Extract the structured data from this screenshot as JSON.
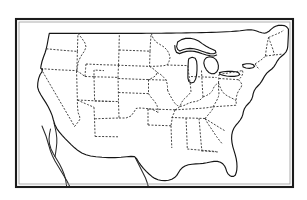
{
  "figure": {
    "title": "Outline map of the contiguous United States",
    "caption": "Black and white line-art map of the lower 48 United States with dashed state boundaries, solid national coastline, the Great Lakes, and a rectangular double-line border frame.",
    "style": "line art, black and white, unlabeled"
  },
  "canvas": {
    "width": 307,
    "height": 200,
    "background_color": "#ffffff"
  },
  "frame": {
    "name": "border-frame",
    "shape": "rectangle",
    "x": 16,
    "y": 19,
    "width": 277,
    "height": 168,
    "outer_stroke_color": "#1c1c1c",
    "outer_stroke_width": 2.1,
    "inner_stroke_color": "#9a9a9a",
    "inner_stroke_width": 0.8,
    "inner_inset": 3,
    "fill_color": "#ffffff"
  },
  "styles": {
    "coastline_color": "#151515",
    "coastline_width": 1.15,
    "state_border_color": "#3b3b3b",
    "state_border_width": 0.95,
    "state_border_dash": "2 1.5",
    "lake_stroke_color": "#151515",
    "lake_fill_color": "#ffffff",
    "neighbor_color": "#2a2a2a"
  },
  "layers": [
    {
      "id": "national-outline",
      "label": "National outline and coastline",
      "visible": true
    },
    {
      "id": "state-boundaries",
      "label": "State boundaries (dashed)",
      "visible": true
    },
    {
      "id": "great-lakes",
      "label": "Great Lakes",
      "visible": true
    },
    {
      "id": "neighbor-outlines",
      "label": "Baja California and adjacent land",
      "visible": true
    }
  ],
  "geography": {
    "regions_depicted": [
      "Pacific Northwest",
      "California coast",
      "Rocky Mountain states",
      "Great Plains",
      "Great Lakes",
      "Northeast and New England",
      "Mid-Atlantic and Chesapeake Bay",
      "Southeast and Florida peninsula",
      "Gulf Coast and Texas"
    ],
    "water_features": [
      "Lake Superior",
      "Lake Michigan",
      "Lake Huron",
      "Lake Erie",
      "Lake Ontario",
      "Chesapeake Bay",
      "Gulf of Mexico",
      "Atlantic Ocean",
      "Pacific Ocean"
    ],
    "state_count": 48,
    "boundary_type": "dashed interior state lines, solid national border"
  },
  "paths": {
    "national_outline": "M 49.5 33.5 L 47.8 40.5 L 46.5 47.0 L 45.2 52.5 L 43.0 57.0 L 41.3 62.5 L 40.8 67.5 L 42.8 69.0 L 41.5 72.5 L 39.5 75.5 L 38.2 80.5 L 37.5 86.0 L 39.0 91.0 L 41.5 95.5 L 44.5 100.5 L 47.5 106.0 L 50.0 111.5 L 52.5 117.0 L 53.5 122.5 L 55.5 127.5 L 58.0 131.5 L 61.5 135.0 L 64.5 138.5 L 67.5 141.5 L 70.5 144.5 L 73.5 147.5 L 76.5 150.5 L 80.0 153.5 L 84.0 155.5 L 88.0 157.0 L 93.0 158.0 L 99.0 158.5 L 105.0 159.0 L 112.0 159.2 L 118.0 159.0 L 124.0 158.5 L 129.5 157.5 L 133.5 157.0 L 137.0 157.5 L 140.0 159.5 L 142.0 162.0 L 144.5 165.0 L 147.5 168.0 L 150.5 171.0 L 153.0 173.5 L 155.5 176.0 L 158.0 178.0 L 161.0 179.5 L 164.0 180.2 L 167.5 180.5 L 171.0 180.3 L 174.5 179.5 L 177.5 178.0 L 180.0 176.0 L 182.0 173.5 L 183.5 171.0 L 185.5 168.5 L 188.0 166.5 L 191.0 165.0 L 194.5 164.0 L 198.0 163.5 L 201.5 163.2 L 205.0 163.0 L 208.5 162.5 L 212.0 161.5 L 215.5 160.5 L 219.0 160.0 L 222.5 160.3 L 225.5 161.5 L 228.0 163.0 L 230.0 165.0 L 231.5 167.5 L 232.5 170.0 L 233.5 172.5 L 235.0 174.5 L 237.0 176.0 L 239.0 176.8 L 241.0 176.5 L 242.5 175.0 L 243.5 172.5 L 244.0 169.5 L 244.0 166.0 L 243.5 162.0 L 242.5 158.0 L 241.0 154.0 L 239.5 150.0 L 238.0 146.0 L 237.0 142.0 L 236.5 138.0 L 236.8 134.0 L 237.5 130.5 L 238.8 127.0 L 240.5 124.0 L 242.5 121.5 L 244.5 119.0 L 246.0 116.5 L 247.0 114.0 L 247.5 111.0 L 248.5 108.0 L 250.0 105.5 L 252.0 103.5 L 254.0 101.5 L 255.5 99.0 L 256.5 96.0 L 257.0 93.0 L 258.0 90.0 L 259.5 87.5 L 261.5 85.5 L 263.5 83.5 L 265.5 81.0 L 267.0 78.0 L 268.5 75.0 L 270.5 72.5 L 273.0 70.5 L 275.5 68.5 L 277.5 66.0 L 279.0 63.0 L 280.5 60.0 L 282.5 57.5 L 285.0 55.5 L 287.5 53.5 L 289.5 51.0 L 290.5 48.0 L 290.8 45.0 L 290.8 41.0 L 290.8 37.0 L 290.8 33.0 L 290.8 28.0 L 289.0 26.0 L 286.5 25.0 L 283.5 24.5 L 280.5 24.5 L 277.5 25.0 L 274.5 26.0 L 272.0 27.5 L 270.0 29.5 L 268.0 31.5 L 266.0 33.0 L 263.5 33.5 L 261.0 33.0 L 258.5 32.0 L 256.0 31.0 L 253.5 30.0 L 251.0 29.5 L 248.0 29.5 L 244.5 30.0 L 241.0 30.5 L 237.0 31.0 L 232.5 31.5 L 228.0 31.8 L 223.0 32.0 L 218.0 32.2 L 213.0 32.3 L 208.0 32.4 L 203.0 32.5 L 198.0 32.6 L 193.0 32.7 L 188.0 32.8 L 183.0 32.9 L 178.0 33.0 L 173.0 33.0 L 168.0 33.1 L 163.0 33.1 L 158.0 33.2 L 153.0 33.2 L 148.0 33.3 L 143.0 33.3 L 138.0 33.4 L 133.0 33.4 L 128.0 33.4 L 123.0 33.4 L 118.0 33.4 L 113.0 33.4 L 108.0 33.4 L 103.0 33.4 L 98.0 33.4 L 93.0 33.4 L 88.0 33.4 L 83.0 33.4 L 78.0 33.4 L 73.0 33.4 L 68.0 33.4 L 63.0 33.4 L 58.0 33.4 Z",
    "state_lines": [
      "M 49.0 33.5 L 48.0 40.0 L 47.0 46.0 L 46.0 50.5",
      "M 46.0 50.5 L 56.0 51.5 L 66.0 52.5 L 76.0 53.0",
      "M 76.0 53.0 L 76.5 45.0 L 77.0 38.0 L 77.5 33.4",
      "M 76.0 53.0 L 76.0 62.0 L 76.0 70.0 L 76.5 78.0",
      "M 46.0 50.5 L 44.5 57.0 L 42.5 63.5 L 41.0 68.5",
      "M 41.0 68.5 L 50.0 69.5 L 60.0 70.5 L 70.0 71.0 L 76.3 71.5",
      "M 76.3 71.5 L 76.5 80.0 L 76.8 88.0 L 77.0 95.0",
      "M 41.0 68.5 L 39.0 76.0 L 38.0 83.0 L 37.5 88.5",
      "M 76.0 53.0 L 86.0 53.5 L 96.0 54.0 L 106.0 54.5 L 115.0 55.0",
      "M 115.0 55.0 L 115.5 46.0 L 116.0 38.0 L 116.5 33.4",
      "M 115.0 55.0 L 114.5 64.0 L 114.0 72.5 L 113.5 80.0",
      "M 76.3 71.5 L 86.0 72.0 L 96.0 72.5 L 106.0 73.0 L 113.5 73.5",
      "M 113.5 73.5 L 113.0 82.0 L 112.5 90.0 L 112.0 98.0",
      "M 77.0 95.0 L 87.0 95.5 L 97.0 96.0 L 107.0 96.5 L 112.0 97.0",
      "M 112.0 97.0 L 111.5 106.0 L 111.0 114.0 L 110.5 122.0",
      "M 77.0 95.0 L 76.5 104.0 L 76.0 112.0 L 75.5 120.0 L 75.0 127.5",
      "M 75.0 127.5 L 85.0 128.0 L 95.0 128.5 L 105.0 129.0 L 110.5 129.5",
      "M 110.5 129.5 L 110.0 138.0 L 109.5 146.0 L 109.0 153.0",
      "M 115.0 55.0 L 124.0 55.5 L 134.0 56.0 L 144.0 56.5 L 152.0 57.0",
      "M 152.0 57.0 L 152.5 48.0 L 153.0 40.0 L 153.5 33.3",
      "M 152.0 57.0 L 151.5 66.0 L 151.0 74.0 L 150.5 81.0",
      "M 113.5 73.5 L 123.0 74.0 L 133.0 74.5 L 143.0 75.0 L 150.5 75.5",
      "M 150.5 75.5 L 150.0 84.0 L 149.5 92.0 L 149.0 99.5",
      "M 112.0 97.0 L 121.0 97.5 L 131.0 98.0 L 141.0 98.5 L 149.0 99.0",
      "M 149.0 99.0 L 148.5 108.0 L 148.0 116.0 L 147.5 123.5",
      "M 110.5 129.5 L 120.0 130.0 L 130.0 130.5 L 140.0 131.0 L 147.5 131.5",
      "M 147.5 131.5 L 147.0 140.0 L 146.5 148.0 L 146.0 155.5",
      "M 152.0 57.0 L 161.0 57.5 L 171.0 58.0 L 180.0 58.5 L 186.0 59.0",
      "M 186.0 59.0 L 186.0 50.0 L 186.0 41.0 L 186.0 33.2",
      "M 186.0 59.0 L 185.5 68.0 L 185.0 76.5 L 184.5 84.0",
      "M 150.5 75.5 L 159.0 76.0 L 169.0 76.5 L 178.0 77.0 L 184.5 77.5",
      "M 184.5 77.5 L 184.0 86.0 L 183.5 94.0 L 183.0 101.5",
      "M 149.0 99.0 L 158.0 99.5 L 168.0 100.0 L 177.0 100.5 L 183.0 101.0",
      "M 183.0 101.0 L 182.5 110.0 L 182.0 118.0 L 181.5 125.5",
      "M 147.5 131.5 L 156.0 132.0 L 166.0 132.5 L 175.0 133.0 L 181.5 133.5",
      "M 181.5 133.5 L 181.0 142.0 L 180.5 150.0 L 180.0 157.0",
      "M 186.0 59.0 L 193.0 60.5 L 199.0 63.0 L 203.5 66.0 L 206.0 69.0",
      "M 184.5 77.5 L 191.0 78.5 L 198.0 79.5 L 205.0 80.5 L 210.0 81.0",
      "M 210.0 81.0 L 211.0 88.0 L 212.0 95.0 L 212.5 101.0",
      "M 183.0 101.0 L 190.0 101.5 L 198.0 102.0 L 206.0 102.5 L 212.5 103.0",
      "M 212.5 103.0 L 213.5 110.0 L 214.5 117.0 L 215.0 123.0",
      "M 181.5 133.5 L 189.0 133.8 L 197.0 134.0 L 205.0 134.3 L 212.0 134.5",
      "M 212.0 134.5 L 212.5 142.0 L 213.0 150.0 L 213.5 157.0",
      "M 206.0 69.0 L 212.0 70.5 L 218.0 72.5 L 223.0 75.0 L 227.0 77.5",
      "M 210.0 81.0 L 216.0 81.5 L 222.0 82.0 L 228.0 82.5 L 233.0 83.0",
      "M 212.5 103.0 L 219.0 103.5 L 226.0 104.0 L 233.0 104.5 L 239.0 105.0",
      "M 212.0 134.5 L 219.0 134.8 L 227.0 135.0 L 234.0 135.3 L 240.0 135.5",
      "M 227.0 77.5 L 231.0 80.5 L 234.0 84.0 L 236.5 88.0 L 238.0 92.0",
      "M 233.0 83.0 L 234.5 89.0 L 236.0 95.0 L 237.5 101.0 L 239.0 105.0",
      "M 239.0 105.0 L 240.0 112.0 L 241.0 119.0 L 241.5 126.0 L 241.0 132.0",
      "M 238.0 92.0 L 243.0 93.0 L 248.0 94.5 L 252.5 96.5 L 256.0 98.5",
      "M 239.0 105.0 L 244.0 104.0 L 249.0 102.5 L 253.0 100.5 L 256.0 98.5",
      "M 227.0 77.5 L 233.0 76.0 L 239.0 74.5 L 245.0 73.0 L 250.0 72.0",
      "M 250.0 72.0 L 253.0 68.5 L 256.0 65.0 L 259.0 62.0 L 262.0 59.5",
      "M 250.0 72.0 L 255.0 71.0 L 260.0 70.0 L 265.0 69.0 L 269.0 68.0",
      "M 262.0 59.5 L 266.5 59.0 L 271.0 58.5 L 275.5 58.0 L 279.0 57.5",
      "M 262.0 59.5 L 263.0 54.0 L 264.0 48.5 L 265.0 43.5 L 266.0 39.0",
      "M 266.0 39.0 L 270.0 38.0 L 274.0 37.0 L 278.0 36.0 L 281.5 35.0",
      "M 274.0 37.0 L 275.0 42.0 L 276.0 47.0 L 277.0 52.0 L 278.0 56.5",
      "M 281.5 35.0 L 283.0 31.0 L 284.5 27.5 L 286.0 25.0",
      "M 279.0 57.5 L 280.5 61.0 L 282.0 64.5 L 283.5 67.5",
      "M 109.0 153.0 L 113.0 154.5 L 118.0 156.0 L 124.0 157.0 L 129.5 157.5",
      "M 146.0 155.5 L 150.0 156.5 L 155.0 157.3 L 160.0 157.8 L 164.5 158.0",
      "M 164.5 158.0 L 170.0 158.3 L 176.0 158.5 L 180.0 157.0",
      "M 180.0 157.0 L 186.0 158.0 L 192.0 159.0 L 198.0 160.0 L 203.0 160.5",
      "M 213.5 157.0 L 219.0 157.5 L 224.0 158.0 L 228.0 159.0",
      "M 203.0 160.5 L 207.0 161.0 L 211.0 161.5 L 214.5 162.0"
    ],
    "great_lakes": [
      "M 178.0 40.5 L 182.0 38.5 L 186.5 37.5 L 191.0 37.5 L 195.5 38.5 L 199.5 40.5 L 203.0 43.0 L 206.5 45.5 L 210.0 47.5 L 213.5 49.0 L 216.0 50.5 L 216.5 53.0 L 214.0 54.5 L 210.5 54.5 L 206.5 53.5 L 202.5 52.0 L 198.5 50.5 L 194.5 49.5 L 190.5 49.0 L 186.5 49.5 L 183.0 50.5 L 180.0 52.0 L 177.5 50.5 L 176.5 47.5 L 176.5 44.0 Z",
      "M 189.0 57.5 L 192.5 56.5 L 195.5 57.5 L 197.0 60.5 L 197.5 65.0 L 197.5 70.0 L 197.0 75.0 L 196.0 79.5 L 194.0 82.5 L 191.0 83.5 L 188.5 82.0 L 187.5 78.5 L 187.5 74.0 L 187.5 69.0 L 187.5 64.0 L 188.0 60.0 Z",
      "M 206.0 57.0 L 209.5 56.0 L 213.0 56.5 L 216.0 58.5 L 218.0 61.5 L 219.0 65.0 L 219.0 68.5 L 217.5 71.5 L 215.0 73.5 L 212.0 74.0 L 209.0 72.5 L 206.5 70.0 L 204.5 66.5 L 203.5 63.0 L 204.0 59.5 Z",
      "M 219.0 73.0 L 223.0 72.0 L 227.5 71.5 L 232.0 71.5 L 236.0 72.0 L 239.0 73.0 L 240.5 75.0 L 238.5 76.5 L 235.0 77.0 L 231.0 77.0 L 227.0 76.5 L 223.0 75.5 L 220.0 74.5 Z",
      "M 243.0 65.0 L 247.0 64.0 L 251.0 64.0 L 254.0 65.0 L 255.5 67.0 L 253.5 68.5 L 250.0 69.0 L 246.5 68.5 L 243.5 67.5 Z"
    ],
    "michigan_upper": "M 176.5 44.0 L 176.5 47.5 L 177.5 50.5 L 180.0 52.0 L 183.0 50.5 L 186.5 49.5 L 190.5 49.0 L 194.5 49.5 L 198.5 50.5 L 202.5 52.0 L 206.5 53.5 L 210.5 54.5 L 214.0 54.5 L 216.5 53.0 L 216.0 55.5 L 213.0 57.0 L 209.0 57.0 L 205.0 56.5 L 201.0 55.5 L 197.0 54.5 L 193.0 54.0 L 189.0 54.0 L 185.0 54.5 L 181.0 55.0 L 177.5 55.0 L 175.5 53.0 L 175.0 49.5 L 175.5 46.0 Z",
    "neighbor_outlines": [
      "M 42.0 126.0 L 44.0 131.0 L 46.0 136.0 L 47.5 141.0 L 49.0 146.0 L 50.5 151.0 L 52.5 156.0 L 55.0 161.0 L 58.0 166.0 L 61.0 171.0 L 64.0 176.0 L 67.0 181.0 L 69.5 185.5",
      "M 49.5 128.0 L 48.5 133.0 L 48.0 138.0 L 48.5 143.0 L 50.0 148.0 L 52.5 153.0 L 55.5 158.0 L 58.5 163.0 L 61.0 168.0 L 63.0 173.0 L 64.5 178.0 L 65.5 183.0 L 66.0 186.5",
      "M 53.5 122.5 L 54.5 127.5 L 55.5 132.5 L 56.0 137.5 L 56.0 142.5 L 55.5 147.5 L 55.0 152.5",
      "M 135.0 158.0 L 137.5 163.0 L 140.0 168.0 L 142.5 173.0 L 145.0 178.0 L 147.0 183.0 L 148.0 186.5"
    ]
  }
}
